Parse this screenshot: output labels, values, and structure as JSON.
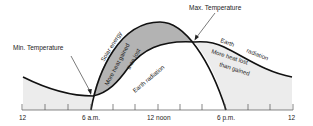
{
  "diagram": {
    "annotations": {
      "min_temperature": "Min.  Temperature",
      "max_temperature": "Max.  Temperature",
      "solar_energy": "Solar energy",
      "earth_radiation_1": "Earth  radiation",
      "earth_radiation_2a": "Earth",
      "earth_radiation_2b": "radiation",
      "gain_region_line1": "More heat gained",
      "gain_region_line2": "than lost",
      "loss_region_line1": "More heat lost",
      "loss_region_line2": "than gained"
    },
    "x_axis": {
      "ticks": [
        "12",
        "6 a.m.",
        "12 noon",
        "6 p.m.",
        "12"
      ]
    },
    "colors": {
      "curve": "#111111",
      "gain_fill": "#b3b3b3",
      "loss_fill": "#ececec",
      "axis": "#555555"
    }
  }
}
